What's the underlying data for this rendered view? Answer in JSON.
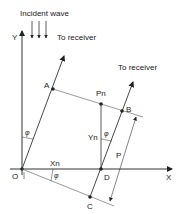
{
  "diagram": {
    "labels": {
      "incident_wave": "Incident wave",
      "to_receiver_1": "To receiver",
      "to_receiver_2": "To receiver",
      "y_axis": "Y",
      "x_axis": "X",
      "origin": "O",
      "point_a": "A",
      "point_pn": "Pn",
      "point_b": "B",
      "point_d": "D",
      "point_c": "C",
      "xn": "Xn",
      "yn": "Yn",
      "p": "P",
      "phi_1": "φ",
      "phi_2": "φ",
      "phi_3": "φ"
    },
    "colors": {
      "line": "#333333",
      "text": "#222222",
      "background": "#ffffff"
    }
  }
}
